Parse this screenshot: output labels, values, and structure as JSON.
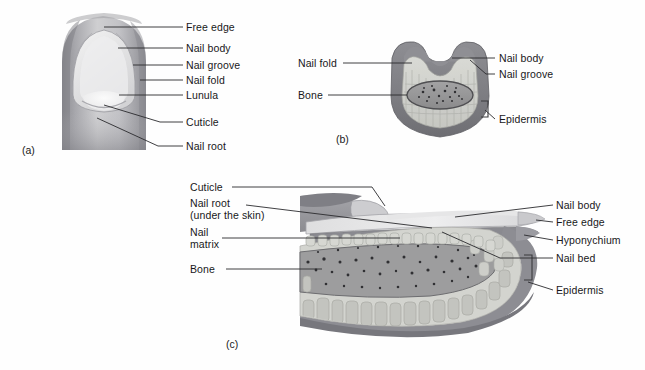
{
  "figure": {
    "panels": [
      {
        "tag": "(a)",
        "name": "surface-view-of-nail",
        "labels": [
          {
            "id": "a-free-edge",
            "text": "Free edge"
          },
          {
            "id": "a-nail-body",
            "text": "Nail body"
          },
          {
            "id": "a-nail-groove",
            "text": "Nail groove"
          },
          {
            "id": "a-nail-fold",
            "text": "Nail fold"
          },
          {
            "id": "a-lunula",
            "text": "Lunula"
          },
          {
            "id": "a-cuticle",
            "text": "Cuticle"
          },
          {
            "id": "a-nail-root",
            "text": "Nail root"
          }
        ]
      },
      {
        "tag": "(b)",
        "name": "cross-section-of-nail",
        "labels": [
          {
            "id": "b-nail-fold",
            "text": "Nail fold"
          },
          {
            "id": "b-bone",
            "text": "Bone"
          },
          {
            "id": "b-nail-body",
            "text": "Nail body"
          },
          {
            "id": "b-nail-groove",
            "text": "Nail groove"
          },
          {
            "id": "b-epidermis",
            "text": "Epidermis"
          }
        ]
      },
      {
        "tag": "(c)",
        "name": "sagittal-section-of-nail",
        "labels": [
          {
            "id": "c-cuticle",
            "text": "Cuticle"
          },
          {
            "id": "c-nail-root-1",
            "text": "Nail root"
          },
          {
            "id": "c-nail-root-2",
            "text": "(under the skin)"
          },
          {
            "id": "c-nail-matrix-1",
            "text": "Nail"
          },
          {
            "id": "c-nail-matrix-2",
            "text": "matrix"
          },
          {
            "id": "c-bone",
            "text": "Bone"
          },
          {
            "id": "c-nail-body",
            "text": "Nail body"
          },
          {
            "id": "c-free-edge",
            "text": "Free edge"
          },
          {
            "id": "c-hyponychium",
            "text": "Hyponychium"
          },
          {
            "id": "c-nail-bed",
            "text": "Nail bed"
          },
          {
            "id": "c-epidermis",
            "text": "Epidermis"
          }
        ]
      }
    ],
    "colors": {
      "background": "#fefefe",
      "label_text": "#18181a",
      "leader_line": "#2a2a2e",
      "skin_dark": "#8d8d92",
      "skin_mid": "#b2b2b6",
      "skin_light": "#d8d8da",
      "nail_plate": "#e9e9ea",
      "lunula": "#f2f2f2",
      "dermis_light": "#d2d3cf",
      "bone_gray": "#9a9a9b",
      "bone_speckle": "#3c3c3e",
      "outline": "#6f6f74"
    }
  }
}
